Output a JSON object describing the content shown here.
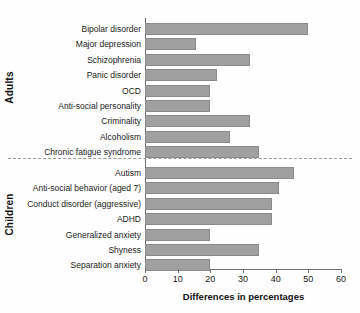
{
  "chart_data": {
    "type": "bar",
    "orientation": "horizontal",
    "title": "",
    "xlabel": "Differences in percentages",
    "ylabel": "",
    "xlim": [
      0,
      60
    ],
    "xticks": [
      0,
      10,
      20,
      30,
      40,
      50,
      60
    ],
    "grid": false,
    "legend": null,
    "bar_color": "#a0a0a0",
    "bar_edge_color": "#8a8a8a",
    "groups": [
      {
        "name": "Adults",
        "categories": [
          "Bipolar disorder",
          "Major depression",
          "Schizophrenia",
          "Panic disorder",
          "OCD",
          "Anti-social personality",
          "Criminality",
          "Alcoholism",
          "Chronic fatigue syndrome"
        ],
        "values": [
          50,
          15.5,
          32,
          22,
          20,
          20,
          32,
          26,
          35
        ]
      },
      {
        "name": "Children",
        "categories": [
          "Autism",
          "Anti-social behavior (aged 7)",
          "Conduct disorder (aggressive)",
          "ADHD",
          "Generalized anxiety",
          "Shyness",
          "Separation anxiety"
        ],
        "values": [
          45.5,
          41,
          39,
          39,
          20,
          35,
          20
        ]
      }
    ],
    "categories": [
      "Bipolar disorder",
      "Major depression",
      "Schizophrenia",
      "Panic disorder",
      "OCD",
      "Anti-social personality",
      "Criminality",
      "Alcoholism",
      "Chronic fatigue syndrome",
      "Autism",
      "Anti-social behavior (aged 7)",
      "Conduct disorder (aggressive)",
      "ADHD",
      "Generalized anxiety",
      "Shyness",
      "Separation anxiety"
    ],
    "values": [
      50,
      15.5,
      32,
      22,
      20,
      20,
      32,
      26,
      35,
      45.5,
      41,
      39,
      39,
      20,
      35,
      20
    ],
    "divider": {
      "style": "dashed",
      "between": [
        "Chronic fatigue syndrome",
        "Autism"
      ]
    }
  }
}
